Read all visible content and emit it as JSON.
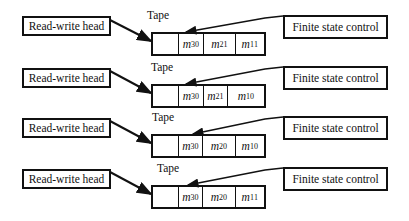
{
  "rows": [
    {
      "head_label": "Read-write head",
      "tape_label": "Tape",
      "control_label": "Finite state control",
      "cells": [
        {
          "var": "",
          "sub": "",
          "sup": ""
        },
        {
          "var": "m",
          "sub": "3",
          "sup": "0"
        },
        {
          "var": "m",
          "sub": "2",
          "sup": "1"
        },
        {
          "var": "m",
          "sub": "1",
          "sup": "1"
        }
      ]
    },
    {
      "head_label": "Read-write head",
      "tape_label": "Tape",
      "control_label": "Finite state control",
      "cells": [
        {
          "var": "",
          "sub": "",
          "sup": ""
        },
        {
          "var": "m",
          "sub": "3",
          "sup": "0"
        },
        {
          "var": "m",
          "sub": "2",
          "sup": "1"
        },
        {
          "var": "m",
          "sub": "1",
          "sup": "0"
        }
      ]
    },
    {
      "head_label": "Read-write head",
      "tape_label": "Tape",
      "control_label": "Finite state control",
      "cells": [
        {
          "var": "",
          "sub": "",
          "sup": ""
        },
        {
          "var": "m",
          "sub": "3",
          "sup": "0"
        },
        {
          "var": "m",
          "sub": "2",
          "sup": "0"
        },
        {
          "var": "m",
          "sub": "1",
          "sup": "0"
        }
      ]
    },
    {
      "head_label": "Read-write head",
      "tape_label": "Tape",
      "control_label": "Finite state control",
      "cells": [
        {
          "var": "",
          "sub": "",
          "sup": ""
        },
        {
          "var": "m",
          "sub": "3",
          "sup": "0"
        },
        {
          "var": "m",
          "sub": "2",
          "sup": "0"
        },
        {
          "var": "m",
          "sub": "1",
          "sup": "1"
        }
      ]
    }
  ]
}
